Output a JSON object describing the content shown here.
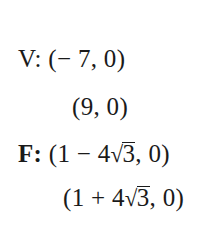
{
  "vertices": {
    "label": "V:",
    "points": [
      {
        "open": "(",
        "x": "− 7",
        "sep": ", ",
        "y": "0",
        "close": ")"
      },
      {
        "open": "(",
        "x": "9",
        "sep": ", ",
        "y": "0",
        "close": ")"
      }
    ]
  },
  "foci": {
    "label": "F:",
    "points": [
      {
        "open": "(",
        "a": "1",
        "op": " − ",
        "coef": "4",
        "radical": "√",
        "radicand": "3",
        "sep": ", ",
        "y": "0",
        "close": ")"
      },
      {
        "open": "(",
        "a": "1",
        "op": " + ",
        "coef": "4",
        "radical": "√",
        "radicand": "3",
        "sep": ", ",
        "y": "0",
        "close": ")"
      }
    ]
  }
}
